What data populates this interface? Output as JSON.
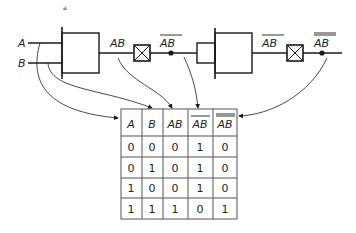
{
  "figure": {
    "stray_mark": "a",
    "inputs": {
      "a": "A",
      "b": "B"
    },
    "signals": {
      "and_out": "AB",
      "nand_out": "AB",
      "and2_out": "AB",
      "final_out": "AB"
    },
    "table": {
      "headers": [
        "A",
        "B",
        "AB",
        "AB",
        "AB"
      ],
      "header_overbars": [
        0,
        0,
        0,
        1,
        2
      ],
      "rows": [
        [
          "0",
          "0",
          "0",
          "1",
          "0"
        ],
        [
          "0",
          "1",
          "0",
          "1",
          "0"
        ],
        [
          "1",
          "0",
          "0",
          "1",
          "0"
        ],
        [
          "1",
          "1",
          "1",
          "0",
          "1"
        ]
      ]
    },
    "colors": {
      "line": "#1a1a1a",
      "background": "#ffffff"
    }
  }
}
